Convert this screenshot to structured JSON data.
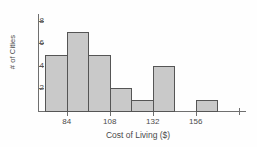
{
  "chart_data": {
    "type": "bar",
    "title": "",
    "xlabel": "Cost of Living ($)",
    "ylabel": "# of Cities",
    "bin_width": 12,
    "bin_starts": [
      72,
      84,
      96,
      108,
      120,
      132,
      144,
      156
    ],
    "bin_edges": [
      72,
      84,
      96,
      108,
      120,
      132,
      144,
      156,
      168
    ],
    "categories": [
      "72-84",
      "84-96",
      "96-108",
      "108-120",
      "120-132",
      "132-144",
      "144-156",
      "156-168"
    ],
    "values": [
      5,
      7,
      5,
      2,
      1,
      4,
      0,
      1
    ],
    "xticks": [
      84,
      108,
      132,
      156
    ],
    "xtick_labels": [
      "84",
      "108",
      "132",
      "156"
    ],
    "yticks": [
      2,
      4,
      6,
      8
    ],
    "ytick_labels": [
      "2",
      "4",
      "6",
      "8"
    ],
    "xlim": [
      68,
      184
    ],
    "ylim": [
      0,
      8.6
    ],
    "grid": false,
    "legend": false,
    "bar_fill_color": "#c9c9c9",
    "bar_edge_color": "#555555",
    "axis_color": "#6f6f6f",
    "text_color": "#4a4a4a"
  },
  "axes": {
    "y_label": "# of Cities",
    "x_label": "Cost of Living ($)"
  },
  "ticks": {
    "y": [
      {
        "label": "8",
        "value": 8
      },
      {
        "label": "6",
        "value": 6
      },
      {
        "label": "4",
        "value": 4
      },
      {
        "label": "2",
        "value": 2
      }
    ],
    "x": [
      {
        "label": "84",
        "value": 84
      },
      {
        "label": "108",
        "value": 108
      },
      {
        "label": "132",
        "value": 132
      },
      {
        "label": "156",
        "value": 156
      }
    ],
    "x_minor": [
      {
        "label": "",
        "value": 180
      }
    ]
  },
  "bars": [
    {
      "label": "72-84",
      "value": 5
    },
    {
      "label": "84-96",
      "value": 7
    },
    {
      "label": "96-108",
      "value": 5
    },
    {
      "label": "108-120",
      "value": 2
    },
    {
      "label": "120-132",
      "value": 1
    },
    {
      "label": "132-144",
      "value": 4
    },
    {
      "label": "144-156",
      "value": 0
    },
    {
      "label": "156-168",
      "value": 1
    }
  ]
}
